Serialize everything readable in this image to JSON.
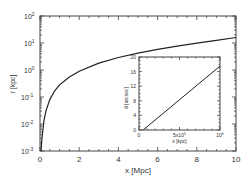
{
  "chart_data": [
    {
      "type": "line",
      "title": "",
      "xlabel": "x [Mpc]",
      "ylabel": "r [kpc]",
      "xlim": [
        0,
        10
      ],
      "ylim": [
        0.001,
        100
      ],
      "yscale": "log",
      "grid": false,
      "x_ticks": [
        "0",
        "2",
        "4",
        "6",
        "8",
        "10"
      ],
      "y_ticks": [
        "10^-3",
        "10^-2",
        "10^-1",
        "10^0",
        "10^1",
        "10^2"
      ],
      "series": [
        {
          "name": "r(x)",
          "x": [
            0.05,
            0.1,
            0.2,
            0.3,
            0.5,
            0.75,
            1,
            1.5,
            2,
            3,
            4,
            5,
            6,
            7,
            8,
            9,
            10
          ],
          "y": [
            0.001,
            0.003,
            0.013,
            0.03,
            0.08,
            0.17,
            0.28,
            0.55,
            0.9,
            1.8,
            2.9,
            4.2,
            5.8,
            7.6,
            9.8,
            12.5,
            16
          ]
        }
      ]
    },
    {
      "type": "line",
      "title": "inset",
      "xlabel": "s [kpc]",
      "ylabel": "θ [arcsec]",
      "xlim": [
        0,
        1000000
      ],
      "ylim": [
        0,
        20
      ],
      "grid": false,
      "x_ticks": [
        "0",
        "5x10^5",
        "10^6"
      ],
      "y_ticks": [
        "0",
        "4",
        "8",
        "12",
        "16",
        "20"
      ],
      "series": [
        {
          "name": "θ(s)",
          "x": [
            50000,
            1000000
          ],
          "y": [
            0,
            17.5
          ]
        }
      ]
    }
  ],
  "main": {
    "xlabel": "x [Mpc]",
    "ylabel": "r [kpc]",
    "xticks": [
      "0",
      "2",
      "4",
      "6",
      "8",
      "10"
    ],
    "yticks": [
      {
        "base": "10",
        "exp": "2"
      },
      {
        "base": "10",
        "exp": "1"
      },
      {
        "base": "10",
        "exp": "0"
      },
      {
        "base": "10",
        "exp": "-1"
      },
      {
        "base": "10",
        "exp": "-2"
      },
      {
        "base": "10",
        "exp": "-3"
      }
    ]
  },
  "inset": {
    "xlabel": "s [kpc]",
    "ylabel": "θ [arcsec]",
    "xticks": [
      {
        "base": "0",
        "exp": ""
      },
      {
        "base": "5x10",
        "exp": "5"
      },
      {
        "base": "10",
        "exp": "6"
      }
    ],
    "yticks": [
      "20",
      "16",
      "12",
      "8",
      "4",
      "0"
    ]
  }
}
